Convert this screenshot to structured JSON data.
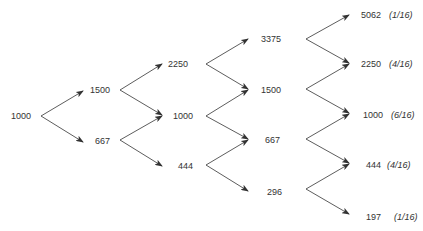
{
  "diagram": {
    "type": "binomial-tree",
    "colors": {
      "line": "#333333",
      "text": "#333333",
      "background": "#ffffff"
    },
    "stages": [
      {
        "nodes": [
          "1000"
        ]
      },
      {
        "nodes": [
          "1500",
          "667"
        ]
      },
      {
        "nodes": [
          "2250",
          "1000",
          "444"
        ]
      },
      {
        "nodes": [
          "3375",
          "1500",
          "667",
          "296"
        ]
      },
      {
        "nodes": [
          "5062",
          "2250",
          "1000",
          "444",
          "197"
        ],
        "probabilities": [
          "(1/16)",
          "(4/16)",
          "(6/16)",
          "(4/16)",
          "(1/16)"
        ]
      }
    ]
  }
}
